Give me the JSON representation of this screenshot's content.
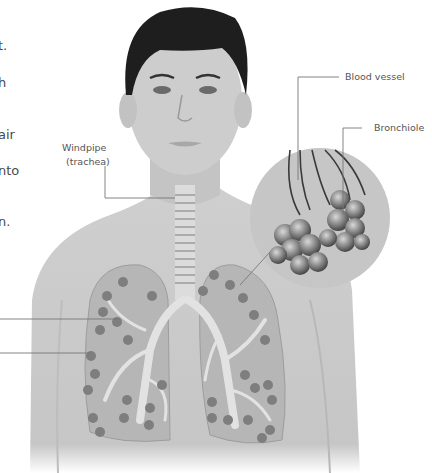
{
  "left_text_fragments": [
    "t.",
    "h",
    "air",
    "nto",
    "n."
  ],
  "labels": {
    "windpipe_line1": "Windpipe",
    "windpipe_line2": "(trachea)",
    "blood_vessel": "Blood vessel",
    "bronchiole": "Bronchiole"
  },
  "colors": {
    "skin": "#c9c9c9",
    "hair": "#1e1e1e",
    "lung": "#b4b4b4",
    "leader_line": "#777777",
    "text": "#4a4a4a"
  }
}
